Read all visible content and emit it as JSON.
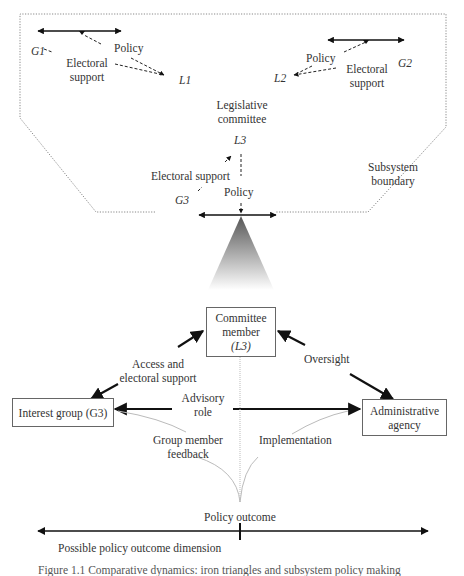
{
  "subsystem": {
    "left_group": {
      "group": "G1",
      "legislator": "L1",
      "policy_label": "Policy",
      "support_label": "Electoral support"
    },
    "right_group": {
      "group": "G2",
      "legislator": "L2",
      "policy_label": "Policy",
      "support_label": "Electoral support"
    },
    "center": {
      "committee_label_line1": "Legislative",
      "committee_label_line2": "committee",
      "legislator": "L3",
      "support_label": "Electoral support",
      "group": "G3",
      "policy_label": "Policy"
    },
    "boundary_label_line1": "Subsystem",
    "boundary_label_line2": "boundary"
  },
  "triangle": {
    "committee_box": {
      "line1": "Committee",
      "line2": "member",
      "line3": "(L3)"
    },
    "interest_group_box": {
      "label": "Interest group (G3)"
    },
    "agency_box": {
      "line1": "Administrative",
      "line2": "agency"
    },
    "edges": {
      "access_line1": "Access and",
      "access_line2": "electoral support",
      "oversight": "Oversight",
      "advisory_line1": "Advisory",
      "advisory_line2": "role",
      "feedback_line1": "Group member",
      "feedback_line2": "feedback",
      "implementation": "Implementation"
    }
  },
  "outcome": {
    "label": "Policy outcome",
    "dimension_label": "Possible policy outcome dimension"
  },
  "caption": "Figure 1.1  Comparative dynamics: iron triangles and subsystem policy making"
}
